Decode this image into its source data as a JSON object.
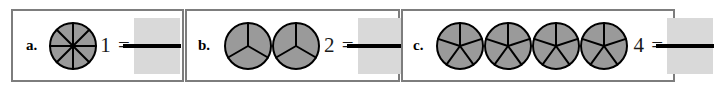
{
  "worksheet": {
    "title": "Fraction circles multiplication worksheet",
    "background_color": "#ffffff",
    "border_color": "#7d7d7d",
    "circle_fill_color": "#9a9a9a",
    "circle_stroke_color": "#000000",
    "answer_box_color": "#d9d9d9",
    "fraction_bar_color": "#000000"
  },
  "problems": [
    {
      "label": "a.",
      "circle_count": 1,
      "sectors_per_circle": 8,
      "expression": "1 =",
      "number": "1",
      "equals": "=",
      "answer": ""
    },
    {
      "label": "b.",
      "circle_count": 2,
      "sectors_per_circle": 3,
      "expression": "2 =",
      "number": "2",
      "equals": "=",
      "answer": ""
    },
    {
      "label": "c.",
      "circle_count": 4,
      "sectors_per_circle": 5,
      "expression": "4 =",
      "number": "4",
      "equals": "=",
      "answer": ""
    }
  ]
}
